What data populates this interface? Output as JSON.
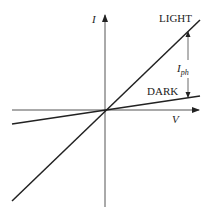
{
  "diagram": {
    "y_axis_label": "I",
    "x_axis_label": "V",
    "curves": [
      {
        "name": "LIGHT",
        "label": "LIGHT"
      },
      {
        "name": "DARK",
        "label": "DARK"
      }
    ],
    "annotation": {
      "main": "I",
      "subscript": "ph"
    },
    "colors": {
      "lines": "#222222",
      "axes": "#444444",
      "background": "#ffffff"
    }
  }
}
